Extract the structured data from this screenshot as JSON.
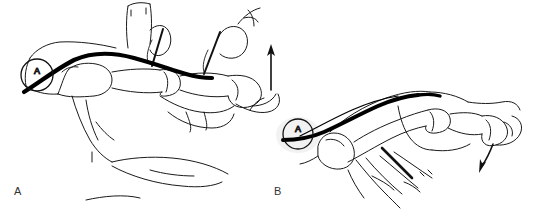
{
  "figure": {
    "caption_labels": {
      "panel_a": "A",
      "panel_b": "B"
    },
    "markers": {
      "graft_marker_a": "A",
      "graft_marker_b": "A"
    },
    "colors": {
      "background": "#ffffff",
      "outline": "#1a1a1a",
      "graft": "#000000",
      "label_text": "#333333",
      "needle": "#111111"
    },
    "panels": [
      {
        "id": "panel-a",
        "label": "A",
        "description": "Lateral view of hand and fingers with tendon graft routed along dorsum of finger; two needle-suture passes and an upward traction arrow at fingertip.",
        "elements": {
          "graft_marker_label": "A",
          "traction_arrow_direction": "up",
          "needle_count": 2
        }
      },
      {
        "id": "panel-b",
        "label": "B",
        "description": "Lateral view of single finger skeleton with tendon graft passing from proximal marker A over the phalanges; needle at volar fingers and a downward arrow at the fingertip.",
        "elements": {
          "graft_marker_label": "A",
          "traction_arrow_direction": "down",
          "needle_count": 1
        }
      }
    ]
  }
}
